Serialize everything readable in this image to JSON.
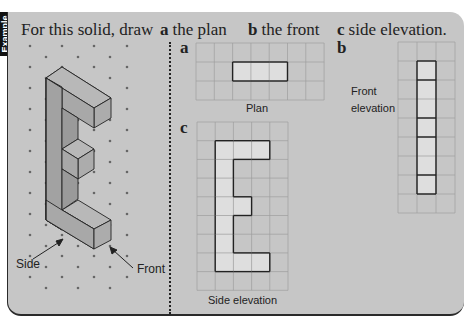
{
  "tab_label": "Example",
  "prompt": {
    "intro": "For this solid, draw",
    "parts": [
      {
        "letter": "a",
        "text": "the plan"
      },
      {
        "letter": "b",
        "text": "the front"
      },
      {
        "letter": "c",
        "text": "side elevation."
      }
    ]
  },
  "isometric": {
    "labels": {
      "side": "Side",
      "front": "Front"
    }
  },
  "plan": {
    "letter": "a",
    "caption": "Plan",
    "grid": {
      "cols": 7,
      "rows": 3
    },
    "filled_cells": [
      [
        1,
        2
      ],
      [
        1,
        3
      ],
      [
        1,
        4
      ]
    ]
  },
  "side_elevation": {
    "letter": "c",
    "caption": "Side elevation",
    "grid": {
      "cols": 5,
      "rows": 9
    },
    "filled_cells": [
      [
        1,
        1
      ],
      [
        1,
        2
      ],
      [
        1,
        3
      ],
      [
        2,
        1
      ],
      [
        3,
        1
      ],
      [
        4,
        1
      ],
      [
        4,
        2
      ],
      [
        5,
        1
      ],
      [
        6,
        1
      ],
      [
        7,
        1
      ],
      [
        7,
        2
      ],
      [
        7,
        3
      ]
    ]
  },
  "front_elevation": {
    "letter": "b",
    "caption_line1": "Front",
    "caption_line2": "elevation",
    "grid": {
      "cols": 3,
      "rows": 9
    },
    "filled_cells": [
      [
        1,
        1
      ],
      [
        2,
        1
      ],
      [
        3,
        1
      ],
      [
        4,
        1
      ],
      [
        5,
        1
      ],
      [
        6,
        1
      ],
      [
        7,
        1
      ]
    ]
  },
  "colors": {
    "panel": "#c6c6c6",
    "grid_line": "#9e9e9e",
    "fill_light": "#dedede",
    "outline": "#222222",
    "iso_top": "#b8b8b8",
    "iso_side": "#a2a2a2",
    "iso_front": "#acacac"
  }
}
